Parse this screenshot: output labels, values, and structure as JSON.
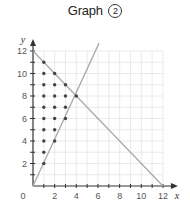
{
  "title": {
    "text": "Graph",
    "number": "2"
  },
  "chart_data": {
    "type": "line",
    "xlabel": "x",
    "ylabel": "y",
    "xlim": [
      0,
      12
    ],
    "ylim": [
      0,
      12
    ],
    "x_ticks": [
      0,
      2,
      4,
      6,
      8,
      10,
      12
    ],
    "y_ticks": [
      2,
      4,
      6,
      8,
      10,
      12
    ],
    "grid": true,
    "series": [
      {
        "name": "y = 12 - x",
        "points": [
          [
            0,
            12
          ],
          [
            12,
            0
          ]
        ]
      },
      {
        "name": "y = 2x",
        "points": [
          [
            0,
            0
          ],
          [
            6.1,
            12.7
          ]
        ]
      }
    ],
    "intersection": [
      4,
      8
    ],
    "lattice_points": [
      [
        1,
        2
      ],
      [
        1,
        3
      ],
      [
        1,
        4
      ],
      [
        1,
        5
      ],
      [
        1,
        6
      ],
      [
        1,
        7
      ],
      [
        1,
        8
      ],
      [
        1,
        9
      ],
      [
        1,
        10
      ],
      [
        1,
        11
      ],
      [
        2,
        4
      ],
      [
        2,
        5
      ],
      [
        2,
        6
      ],
      [
        2,
        7
      ],
      [
        2,
        8
      ],
      [
        2,
        9
      ],
      [
        2,
        10
      ],
      [
        3,
        6
      ],
      [
        3,
        7
      ],
      [
        3,
        8
      ],
      [
        3,
        9
      ],
      [
        4,
        8
      ]
    ],
    "colors": {
      "grid": "#e4e4e4",
      "axis": "#333333",
      "line": "#aaaaaa",
      "dot": "#444444"
    }
  }
}
